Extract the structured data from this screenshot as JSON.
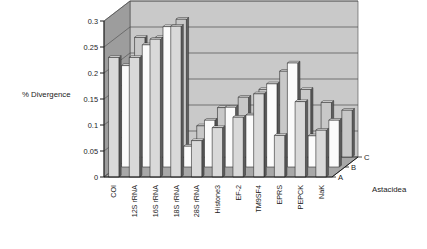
{
  "chart_data": {
    "type": "bar",
    "title": "",
    "subtitle": "",
    "xlabel": "",
    "ylabel": "% Divergence",
    "zlabel": "Astacidea",
    "ylim": [
      0,
      0.3
    ],
    "ytick_labels": [
      "0",
      "0.05",
      "0.1",
      "0.15",
      "0.2",
      "0.25",
      "0.3"
    ],
    "ytick_values": [
      0,
      0.05,
      0.1,
      0.15,
      0.2,
      0.25,
      0.3
    ],
    "grid": true,
    "legend_position": "depth-axis-right",
    "three_d": true,
    "categories": [
      "COI",
      "12S rRNA",
      "16S rRNA",
      "18S rRNA",
      "28S rRNA",
      "Histone3",
      "EF-2",
      "TM9SF4",
      "EPRS",
      "PEPCK",
      "NaK"
    ],
    "series": [
      {
        "name": "A",
        "color": "#d9d9d9",
        "values": [
          0.23,
          0.23,
          0.265,
          0.29,
          0.07,
          0.095,
          0.115,
          0.16,
          0.08,
          0.145,
          0.09
        ]
      },
      {
        "name": "B",
        "color": "#fbfbfb",
        "values": [
          0.195,
          0.235,
          0.27,
          0.04,
          0.09,
          0.115,
          0.1,
          0.16,
          0.2,
          0.06,
          0.09
        ]
      },
      {
        "name": "C",
        "color": "#c8c8c8",
        "values": [
          0.23,
          0.23,
          0.265,
          0.06,
          0.095,
          0.115,
          0.13,
          0.165,
          0.13,
          0.105,
          0.09
        ]
      }
    ],
    "colors": {
      "back_wall": "#c9c9c9",
      "side_wall": "#9d9d9d",
      "floor": "#a8a8a8",
      "gridline": "#4a4a4a",
      "axis": "#1a1a1a",
      "bar_front_a": "#d9d9d9",
      "bar_front_b": "#fbfbfb",
      "bar_front_c": "#c8c8c8",
      "bar_outline": "#2b2b2b"
    }
  }
}
